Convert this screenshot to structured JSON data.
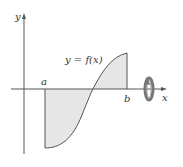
{
  "diagram": {
    "y_axis_label": "y",
    "x_axis_label": "x",
    "curve_label": "y = f(x)",
    "left_bound_label": "a",
    "right_bound_label": "b",
    "colors": {
      "axis": "#555555",
      "curve": "#555555",
      "fill": "#e6e6e6",
      "rotation_icon": "#777777"
    },
    "rotation_icon": "rotation-about-x-axis"
  }
}
